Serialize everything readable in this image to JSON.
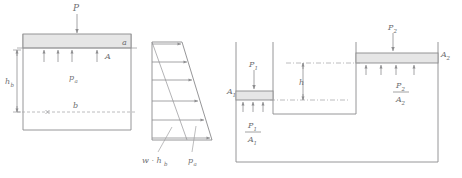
{
  "figure": {
    "panel_count": 3,
    "colors": {
      "line": "#8a8a8c",
      "thin_line": "#9a9a9c",
      "dashed_line": "#a6a6a8",
      "piston_fill": "#e6e6e6",
      "label_text": "#6e6e70",
      "background": "#ffffff"
    }
  },
  "panel_left": {
    "name": "piston-cylinder-column",
    "labels": {
      "applied_force": "P",
      "applied_force_sub": "",
      "area": "A",
      "level_a": "a",
      "level_b": "b",
      "pressure": "p",
      "pressure_sub": "a",
      "depth": "h",
      "depth_sub": "b"
    }
  },
  "panel_middle": {
    "name": "pressure-distribution-trapezoid",
    "labels": {
      "hydrostatic": "w · h",
      "hydrostatic_sub": "b",
      "applied_pressure": "p",
      "applied_pressure_sub": "a"
    },
    "arrow_count": 6
  },
  "panel_right": {
    "name": "hydraulic-press",
    "labels": {
      "force_small": "P",
      "force_small_sub": "1",
      "area_small": "A",
      "area_small_sub": "1",
      "pressure_small_num": "P",
      "pressure_small_num_sub": "1",
      "pressure_small_den": "A",
      "pressure_small_den_sub": "1",
      "force_large": "P",
      "force_large_sub": "2",
      "area_large": "A",
      "area_large_sub": "2",
      "pressure_large_num": "P",
      "pressure_large_num_sub": "2",
      "pressure_large_den": "A",
      "pressure_large_den_sub": "2",
      "height_difference": "h"
    }
  }
}
